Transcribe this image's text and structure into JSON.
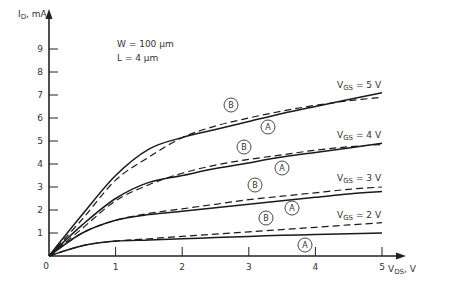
{
  "chart_data": {
    "type": "line",
    "title": "",
    "xlabel": "V_DS, V",
    "ylabel": "I_D, mA",
    "xlim": [
      0,
      5
    ],
    "ylim": [
      0,
      10
    ],
    "x_ticks": [
      "0",
      "1",
      "2",
      "3",
      "4",
      "5"
    ],
    "y_ticks": [
      "1",
      "2",
      "3",
      "4",
      "5",
      "6",
      "7",
      "8",
      "9"
    ],
    "grid": false,
    "annotations": {
      "width": "W = 100 μm",
      "length": "L = 4 μm"
    },
    "legend_markers": {
      "A": "solid curve",
      "B": "dashed curve"
    },
    "x": [
      0,
      0.5,
      1,
      1.5,
      2,
      2.5,
      3,
      3.5,
      4,
      4.5,
      5
    ],
    "series": [
      {
        "name": "V_GS = 5 V (A)",
        "style": "solid",
        "values": [
          0,
          1.8,
          3.5,
          4.65,
          5.15,
          5.5,
          5.85,
          6.2,
          6.5,
          6.8,
          7.1
        ]
      },
      {
        "name": "V_GS = 5 V (B)",
        "style": "dashed",
        "values": [
          0,
          1.6,
          3.3,
          4.3,
          5.15,
          5.65,
          6.0,
          6.3,
          6.55,
          6.75,
          6.9
        ]
      },
      {
        "name": "V_GS = 4 V (A)",
        "style": "solid",
        "values": [
          0,
          1.35,
          2.5,
          3.2,
          3.5,
          3.8,
          4.05,
          4.3,
          4.5,
          4.7,
          4.9
        ]
      },
      {
        "name": "V_GS = 4 V (B)",
        "style": "dashed",
        "values": [
          0,
          1.2,
          2.4,
          3.1,
          3.6,
          3.95,
          4.2,
          4.4,
          4.6,
          4.75,
          4.85
        ]
      },
      {
        "name": "V_GS = 3 V (A)",
        "style": "solid",
        "values": [
          0,
          1.0,
          1.55,
          1.8,
          1.95,
          2.1,
          2.25,
          2.4,
          2.55,
          2.7,
          2.8
        ]
      },
      {
        "name": "V_GS = 3 V (B)",
        "style": "dashed",
        "values": [
          0,
          1.0,
          1.55,
          1.85,
          2.05,
          2.25,
          2.45,
          2.6,
          2.75,
          2.9,
          3.0
        ]
      },
      {
        "name": "V_GS = 2 V (A)",
        "style": "solid",
        "values": [
          0,
          0.45,
          0.65,
          0.7,
          0.75,
          0.8,
          0.85,
          0.9,
          0.93,
          0.97,
          1.0
        ]
      },
      {
        "name": "V_GS = 2 V (B)",
        "style": "dashed",
        "values": [
          0,
          0.45,
          0.65,
          0.75,
          0.85,
          0.95,
          1.05,
          1.15,
          1.25,
          1.35,
          1.45
        ]
      }
    ],
    "curve_labels": [
      {
        "text": "V_GS = 5 V",
        "main": "V",
        "sub": "GS",
        "rest": " = 5 V"
      },
      {
        "text": "V_GS = 4 V",
        "main": "V",
        "sub": "GS",
        "rest": " = 4 V"
      },
      {
        "text": "V_GS = 3 V",
        "main": "V",
        "sub": "GS",
        "rest": " = 3 V"
      },
      {
        "text": "V_GS = 2 V",
        "main": "V",
        "sub": "GS",
        "rest": " = 2 V"
      }
    ]
  },
  "axis_labels": {
    "y_main": "I",
    "y_sub": "D",
    "y_rest": ", mA",
    "x_main": "V",
    "x_sub": "DS",
    "x_rest": ", V",
    "origin": "0"
  },
  "markers": {
    "A": "A",
    "B": "B"
  }
}
